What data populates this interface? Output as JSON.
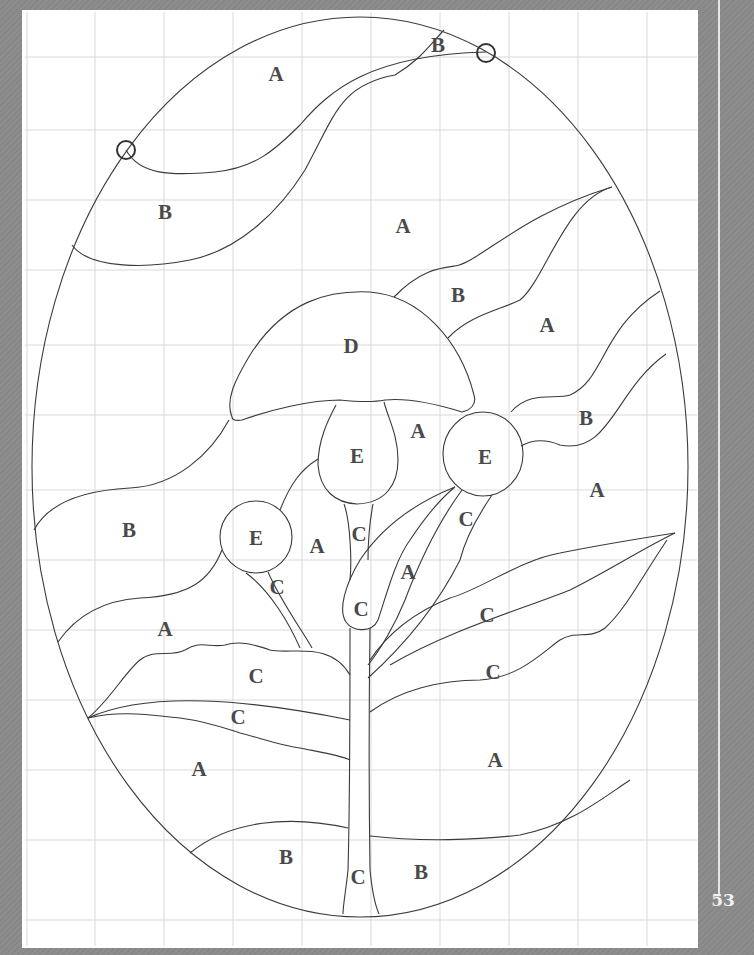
{
  "page": {
    "number": "53",
    "frame_color": "#8c8c8c",
    "paper_color": "#ffffff",
    "grid_color": "#d9d9d9",
    "line_color": "#3a3a3a"
  },
  "pattern": {
    "subject": "mushroom and leaves oval stained glass pattern",
    "registration_marks": 2,
    "labels": [
      {
        "text": "A",
        "x": 276,
        "y": 74
      },
      {
        "text": "B",
        "x": 438,
        "y": 45
      },
      {
        "text": "B",
        "x": 165,
        "y": 212
      },
      {
        "text": "A",
        "x": 403,
        "y": 226
      },
      {
        "text": "B",
        "x": 458,
        "y": 295
      },
      {
        "text": "A",
        "x": 547,
        "y": 325
      },
      {
        "text": "D",
        "x": 351,
        "y": 346
      },
      {
        "text": "B",
        "x": 586,
        "y": 418
      },
      {
        "text": "A",
        "x": 418,
        "y": 431
      },
      {
        "text": "E",
        "x": 357,
        "y": 456
      },
      {
        "text": "E",
        "x": 485,
        "y": 457
      },
      {
        "text": "A",
        "x": 597,
        "y": 490
      },
      {
        "text": "B",
        "x": 129,
        "y": 530
      },
      {
        "text": "C",
        "x": 466,
        "y": 519
      },
      {
        "text": "E",
        "x": 256,
        "y": 538
      },
      {
        "text": "C",
        "x": 359,
        "y": 534
      },
      {
        "text": "A",
        "x": 317,
        "y": 546
      },
      {
        "text": "A",
        "x": 408,
        "y": 572
      },
      {
        "text": "C",
        "x": 277,
        "y": 587
      },
      {
        "text": "C",
        "x": 361,
        "y": 609
      },
      {
        "text": "C",
        "x": 487,
        "y": 615
      },
      {
        "text": "A",
        "x": 165,
        "y": 629
      },
      {
        "text": "C",
        "x": 256,
        "y": 676
      },
      {
        "text": "C",
        "x": 493,
        "y": 672
      },
      {
        "text": "C",
        "x": 238,
        "y": 717
      },
      {
        "text": "A",
        "x": 199,
        "y": 769
      },
      {
        "text": "A",
        "x": 495,
        "y": 760
      },
      {
        "text": "B",
        "x": 286,
        "y": 857
      },
      {
        "text": "C",
        "x": 358,
        "y": 877
      },
      {
        "text": "B",
        "x": 421,
        "y": 872
      }
    ]
  }
}
